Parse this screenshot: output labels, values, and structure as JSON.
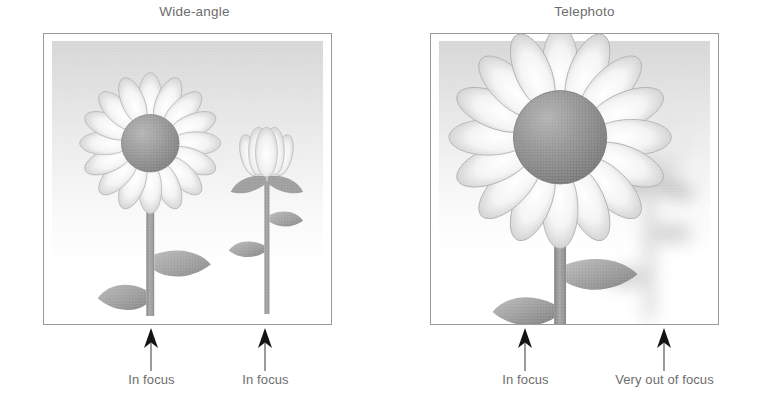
{
  "figure": {
    "caption_topic": "Depth of field: wide-angle vs telephoto",
    "background_color": "#ffffff",
    "text_color": "#6d6d6d",
    "frame_border_color": "#9a9a9a",
    "arrow_color": "#1b1b1b"
  },
  "panels": [
    {
      "id": "wide-angle",
      "title": "Wide-angle",
      "photo": {
        "sky_top_color": "#d8d8d8",
        "sky_bottom_color": "#fbfbfb",
        "subjects": [
          {
            "name": "foreground-flower",
            "blur": 0,
            "focus_state": "In focus",
            "size": "large",
            "petal_count": 16,
            "center_color": "#8e8e8e",
            "petal_color": "#f2f2f2",
            "stem_color": "#9a9a9a"
          },
          {
            "name": "background-flower-bud",
            "blur": 0,
            "focus_state": "In focus",
            "size": "small",
            "petal_count": 5,
            "center_color": "#cfcfcf",
            "petal_color": "#f0f0f0",
            "stem_color": "#a5a5a5"
          }
        ]
      },
      "callouts": [
        {
          "label": "In focus",
          "x": 151,
          "y": 328
        },
        {
          "label": "In focus",
          "x": 265,
          "y": 328
        }
      ]
    },
    {
      "id": "telephoto",
      "title": "Telephoto",
      "photo": {
        "sky_top_color": "#d8d8d8",
        "sky_bottom_color": "#fbfbfb",
        "subjects": [
          {
            "name": "foreground-flower",
            "blur": 0,
            "focus_state": "In focus",
            "size": "very large",
            "petal_count": 16,
            "center_color": "#8a8a8a",
            "petal_color": "#f2f2f2",
            "stem_color": "#9a9a9a"
          },
          {
            "name": "background-flower-bud",
            "blur": 14,
            "focus_state": "Very out of focus",
            "size": "medium",
            "petal_count": 5,
            "center_color": "#dcdcdc",
            "petal_color": "#ededed",
            "stem_color": "#d2d2d2"
          }
        ]
      },
      "callouts": [
        {
          "label": "In focus",
          "x": 525,
          "y": 328
        },
        {
          "label": "Very out of focus",
          "x": 664,
          "y": 328
        }
      ]
    }
  ]
}
